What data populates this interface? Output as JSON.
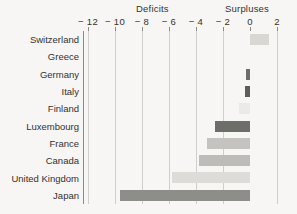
{
  "headings": {
    "deficits": "Deficits",
    "surpluses": "Surpluses"
  },
  "chart_data": {
    "type": "bar",
    "orientation": "horizontal",
    "title": "",
    "subtitle": "",
    "xlabel": "",
    "ylabel": "",
    "xlim": [
      -13,
      2.6
    ],
    "grid": true,
    "legend": "none",
    "section_labels": [
      "Deficits",
      "Surpluses"
    ],
    "tick_labels": [
      "− 12",
      "− 10",
      "− 8",
      "− 6",
      "− 4",
      "− 2",
      "0",
      "2"
    ],
    "ticks": [
      -12,
      -10,
      -8,
      -6,
      -4,
      -2,
      0,
      2
    ],
    "categories": [
      "Switzerland",
      "Greece",
      "Germany",
      "Italy",
      "Finland",
      "Luxembourg",
      "France",
      "Canada",
      "United Kingdom",
      "Japan"
    ],
    "values": [
      1.4,
      0,
      -0.3,
      -0.4,
      -0.8,
      -2.6,
      -3.2,
      -3.8,
      -5.8,
      -9.6
    ],
    "bar_colors": [
      "#d8d7d3",
      "#d8d7d3",
      "#6d6d6a",
      "#5d5d5a",
      "#eceae7",
      "#6d6d6a",
      "#c4c3bf",
      "#bdbcb8",
      "#dddcd8",
      "#8d8d89"
    ]
  },
  "colors": {
    "background": "#f7f6f4",
    "axis": "#8a8a86",
    "gridline": "#cfcecb",
    "text": "#33322f"
  }
}
